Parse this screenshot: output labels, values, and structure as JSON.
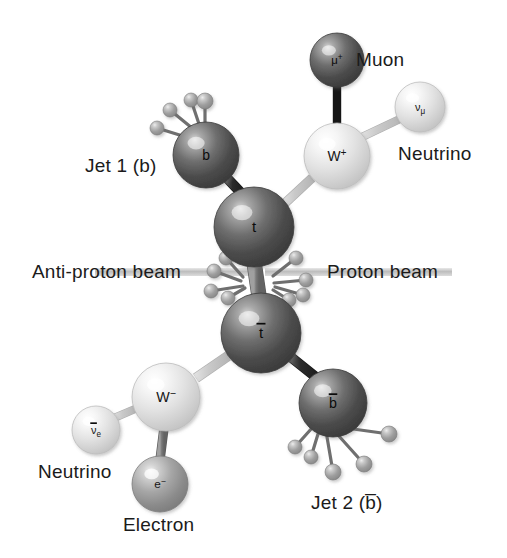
{
  "figure": {
    "background_color": "#ffffff",
    "width": 507,
    "height": 558
  },
  "colors": {
    "sphere_dark": "#4d4d4d",
    "sphere_mid": "#8f8f8f",
    "sphere_light": "#e8e8e8",
    "sphere_small": "#9a9a9a",
    "bond_dark": "#2b2b2b",
    "bond_light": "#c9c9c9",
    "bond_mid": "#777777",
    "beam_line": "#c0c0c0",
    "text": "#1b1b1b"
  },
  "callouts": [
    {
      "id": "muon",
      "text": "Muon",
      "x": 356,
      "y": 66,
      "anchor": "start"
    },
    {
      "id": "neutrino-mu",
      "text": "Neutrino",
      "x": 398,
      "y": 160,
      "anchor": "start"
    },
    {
      "id": "jet1",
      "text": "Jet 1 (b)",
      "x": 85,
      "y": 172,
      "anchor": "start"
    },
    {
      "id": "antiproton-beam",
      "text": "Anti-proton beam",
      "x": 32,
      "y": 278,
      "anchor": "start"
    },
    {
      "id": "proton-beam",
      "text": "Proton beam",
      "x": 327,
      "y": 278,
      "anchor": "start"
    },
    {
      "id": "neutrino-e",
      "text": "Neutrino",
      "x": 38,
      "y": 478,
      "anchor": "start"
    },
    {
      "id": "electron",
      "text": "Electron",
      "x": 123,
      "y": 531,
      "anchor": "start"
    },
    {
      "id": "jet2",
      "text": "Jet 2 (b̅)",
      "x": 311,
      "y": 509,
      "anchor": "start"
    }
  ],
  "particles": [
    {
      "id": "muon",
      "label": "μ",
      "superscript": "+",
      "overbar": false,
      "subscript": "",
      "shade": "dark",
      "cx": 337,
      "cy": 60,
      "r": 27
    },
    {
      "id": "neutrino-mu",
      "label": "ν",
      "superscript": "",
      "overbar": false,
      "subscript": "μ",
      "shade": "light",
      "cx": 420,
      "cy": 107,
      "r": 25
    },
    {
      "id": "w-plus",
      "label": "W",
      "superscript": "+",
      "overbar": false,
      "subscript": "",
      "shade": "light",
      "cx": 337,
      "cy": 156,
      "r": 33
    },
    {
      "id": "b-quark",
      "label": "b",
      "superscript": "",
      "overbar": false,
      "subscript": "",
      "shade": "dark",
      "cx": 206,
      "cy": 155,
      "r": 33
    },
    {
      "id": "top-quark",
      "label": "t",
      "superscript": "",
      "overbar": false,
      "subscript": "",
      "shade": "dark",
      "cx": 254,
      "cy": 227,
      "r": 40
    },
    {
      "id": "antitop-quark",
      "label": "t",
      "superscript": "",
      "overbar": true,
      "subscript": "",
      "shade": "dark",
      "cx": 261,
      "cy": 333,
      "r": 40
    },
    {
      "id": "w-minus",
      "label": "W",
      "superscript": "−",
      "overbar": false,
      "subscript": "",
      "shade": "light",
      "cx": 166,
      "cy": 397,
      "r": 34
    },
    {
      "id": "antineutrino-e",
      "label": "ν",
      "superscript": "",
      "overbar": true,
      "subscript": "e",
      "shade": "light",
      "cx": 96,
      "cy": 430,
      "r": 24
    },
    {
      "id": "electron",
      "label": "e",
      "superscript": "−",
      "overbar": false,
      "subscript": "",
      "shade": "mid",
      "cx": 160,
      "cy": 484,
      "r": 28
    },
    {
      "id": "antib-quark",
      "label": "b",
      "superscript": "",
      "overbar": true,
      "subscript": "",
      "shade": "dark",
      "cx": 333,
      "cy": 403,
      "r": 34
    }
  ],
  "bonds": [
    {
      "id": "muon-to-wplus",
      "x1": 337,
      "y1": 85,
      "x2": 337,
      "y2": 130,
      "width": 7,
      "tone": "dark"
    },
    {
      "id": "wplus-to-numu",
      "x1": 362,
      "y1": 137,
      "x2": 402,
      "y2": 118,
      "width": 7,
      "tone": "light"
    },
    {
      "id": "wplus-to-top",
      "x1": 312,
      "y1": 178,
      "x2": 283,
      "y2": 205,
      "width": 8,
      "tone": "light"
    },
    {
      "id": "bquark-to-top",
      "x1": 227,
      "y1": 178,
      "x2": 243,
      "y2": 195,
      "width": 9,
      "tone": "dark"
    },
    {
      "id": "top-to-antitop",
      "x1": 254,
      "y1": 262,
      "x2": 259,
      "y2": 296,
      "width": 14,
      "tone": "mid"
    },
    {
      "id": "antitop-to-wminus",
      "x1": 228,
      "y1": 356,
      "x2": 196,
      "y2": 378,
      "width": 9,
      "tone": "light"
    },
    {
      "id": "antitop-to-antib",
      "x1": 292,
      "y1": 358,
      "x2": 317,
      "y2": 378,
      "width": 9,
      "tone": "dark"
    },
    {
      "id": "wminus-to-antinue",
      "x1": 135,
      "y1": 409,
      "x2": 114,
      "y2": 418,
      "width": 7,
      "tone": "light"
    },
    {
      "id": "wminus-to-electron",
      "x1": 164,
      "y1": 428,
      "x2": 160,
      "y2": 460,
      "width": 8,
      "tone": "mid"
    }
  ],
  "jet_tracks": {
    "b_quark": [
      {
        "x1": 192,
        "y1": 128,
        "x2": 170,
        "y2": 110,
        "r": 7
      },
      {
        "x1": 199,
        "y1": 124,
        "x2": 191,
        "y2": 100,
        "r": 7
      },
      {
        "x1": 205,
        "y1": 123,
        "x2": 205,
        "y2": 101,
        "r": 8
      },
      {
        "x1": 186,
        "y1": 137,
        "x2": 157,
        "y2": 128,
        "r": 7
      }
    ],
    "antib_quark": [
      {
        "x1": 346,
        "y1": 428,
        "x2": 389,
        "y2": 434,
        "r": 8
      },
      {
        "x1": 338,
        "y1": 435,
        "x2": 364,
        "y2": 464,
        "r": 8
      },
      {
        "x1": 327,
        "y1": 437,
        "x2": 333,
        "y2": 472,
        "r": 8
      },
      {
        "x1": 318,
        "y1": 434,
        "x2": 311,
        "y2": 457,
        "r": 7
      },
      {
        "x1": 312,
        "y1": 428,
        "x2": 295,
        "y2": 447,
        "r": 7
      }
    ],
    "collision_left": [
      {
        "x1": 243,
        "y1": 277,
        "x2": 226,
        "y2": 258,
        "r": 7
      },
      {
        "x1": 241,
        "y1": 281,
        "x2": 214,
        "y2": 271,
        "r": 7
      },
      {
        "x1": 243,
        "y1": 286,
        "x2": 211,
        "y2": 291,
        "r": 7
      },
      {
        "x1": 245,
        "y1": 288,
        "x2": 228,
        "y2": 298,
        "r": 7
      }
    ],
    "collision_right": [
      {
        "x1": 273,
        "y1": 276,
        "x2": 296,
        "y2": 258,
        "r": 7
      },
      {
        "x1": 274,
        "y1": 283,
        "x2": 306,
        "y2": 280,
        "r": 7
      },
      {
        "x1": 275,
        "y1": 287,
        "x2": 303,
        "y2": 295,
        "r": 7
      },
      {
        "x1": 273,
        "y1": 290,
        "x2": 289,
        "y2": 300,
        "r": 7
      }
    ]
  },
  "beams": [
    {
      "id": "antiproton-beam-line",
      "x1": 95,
      "y1": 272,
      "x2": 252,
      "y2": 272
    },
    {
      "id": "proton-beam-line",
      "x1": 265,
      "y1": 272,
      "x2": 452,
      "y2": 272
    }
  ]
}
